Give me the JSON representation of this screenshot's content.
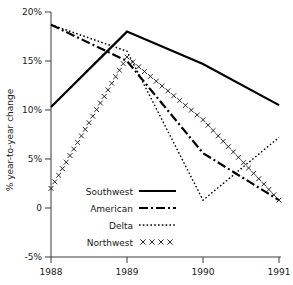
{
  "chart_data": {
    "type": "line",
    "title": "",
    "xlabel": "",
    "ylabel": "% year-to-year change",
    "x": [
      1988,
      1989,
      1990,
      1991
    ],
    "xtick_labels": [
      "1988",
      "1989",
      "1990",
      "1991"
    ],
    "ytick_labels": [
      "20%",
      "15%",
      "10%",
      "5%",
      "0",
      "-5%"
    ],
    "ytick_values": [
      20,
      15,
      10,
      5,
      0,
      -5
    ],
    "ylim": [
      -5,
      20
    ],
    "xlim": [
      1988,
      1991
    ],
    "grid": false,
    "legend_position": "inside-lower-left",
    "series": [
      {
        "name": "Southwest",
        "style": "solid",
        "color": "#000000",
        "values": [
          10.3,
          18.0,
          14.7,
          10.5
        ]
      },
      {
        "name": "American",
        "style": "dash-dot",
        "color": "#000000",
        "values": [
          18.7,
          15.0,
          5.6,
          0.8
        ]
      },
      {
        "name": "Delta",
        "style": "dotted",
        "color": "#000000",
        "values": [
          18.7,
          16.0,
          0.8,
          7.2
        ]
      },
      {
        "name": "Northwest",
        "style": "x-markers",
        "color": "#000000",
        "values": [
          2.0,
          15.4,
          9.0,
          0.8
        ]
      }
    ]
  },
  "axis": {
    "y_label": "% year-to-year change",
    "y_ticks": [
      "20%",
      "15%",
      "10%",
      "5%",
      "0",
      "-5%"
    ],
    "x_ticks": [
      "1988",
      "1989",
      "1990",
      "1991"
    ]
  },
  "legend": {
    "items": [
      {
        "label": "Southwest",
        "style": "solid"
      },
      {
        "label": "American",
        "style": "dash-dot"
      },
      {
        "label": "Delta",
        "style": "dotted"
      },
      {
        "label": "Northwest",
        "style": "x-markers"
      }
    ]
  }
}
